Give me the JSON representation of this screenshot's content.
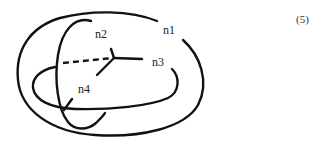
{
  "figure": {
    "equation_number": "(5)",
    "nodes": [
      {
        "id": "n1",
        "label": "n1"
      },
      {
        "id": "n2",
        "label": "n2"
      },
      {
        "id": "n3",
        "label": "n3"
      },
      {
        "id": "n4",
        "label": "n4"
      }
    ],
    "colors": {
      "stroke": "#111111",
      "background": "#ffffff"
    }
  }
}
